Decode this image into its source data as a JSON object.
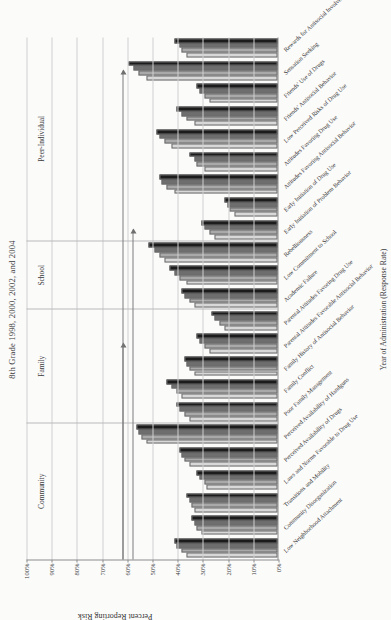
{
  "figure": {
    "title": "8th Grade 1998, 2000, 2002, and 2004",
    "x_caption": "Year of Administration (Response Rate)",
    "y_axis_label": "Percent Reporting Risk"
  },
  "chart_data": {
    "type": "bar",
    "title": "8th Grade 1998, 2000, 2002, and 2004",
    "xlabel": "Year of Administration (Response Rate)",
    "ylabel": "Percent Reporting Risk",
    "ylim": [
      0,
      100
    ],
    "grid": true,
    "legend_position": "none",
    "tick_labels": [
      "100%",
      "90%",
      "80%",
      "70%",
      "60%",
      "50%",
      "40%",
      "30%",
      "20%",
      "10%",
      "0%"
    ],
    "tick_values": [
      100,
      90,
      80,
      70,
      60,
      50,
      40,
      30,
      20,
      10,
      0
    ],
    "domains": [
      {
        "name": "Community",
        "start": 0,
        "end": 6
      },
      {
        "name": "Family",
        "start": 6,
        "end": 11
      },
      {
        "name": "School",
        "start": 11,
        "end": 14
      },
      {
        "name": "Peer-Individual",
        "start": 14,
        "end": 23
      }
    ],
    "categories": [
      "Low Neighborhood Attachment",
      "Community Disorganization",
      "Transitions and Mobility",
      "Laws and Norms Favorable to Drug Use",
      "Perceived Availability of Drugs",
      "Perceived Availability of Handguns",
      "Poor Family Management",
      "Family Conflict",
      "Family History of Antisocial Behavior",
      "Parental Attitudes Favorable Antisocial Behavior",
      "Parental Attitudes Favoring Drug Use",
      "Academic Failure",
      "Low Commitment to School",
      "Rebelliousness",
      "Early Initiation of Problem Behavior",
      "Early Initiation of Drug Use",
      "Attitudes Favoring Antisocial Behavior",
      "Attitudes Favoring Drug Use",
      "Low Perceived Risks of Drug Use",
      "Friends' Antisocial Behavior",
      "Friends' Use of Drugs",
      "Sensation Seeking",
      "Rewards for Antisocial Involvement"
    ],
    "series": [
      {
        "name": "1998",
        "color": "#d8d8d8",
        "values": [
          36,
          30,
          33,
          28,
          35,
          52,
          35,
          38,
          33,
          27,
          21,
          33,
          36,
          45,
          25,
          17,
          41,
          29,
          42,
          33,
          27,
          52,
          36
        ]
      },
      {
        "name": "2000",
        "color": "#a9a9a9",
        "values": [
          38,
          32,
          34,
          29,
          37,
          54,
          37,
          40,
          35,
          29,
          23,
          35,
          39,
          47,
          27,
          19,
          44,
          32,
          45,
          36,
          29,
          55,
          38
        ]
      },
      {
        "name": "2002",
        "color": "#6e6e6e",
        "values": [
          40,
          33,
          35,
          31,
          38,
          55,
          39,
          42,
          36,
          31,
          25,
          37,
          41,
          49,
          29,
          20,
          46,
          33,
          47,
          38,
          31,
          57,
          39
        ]
      },
      {
        "name": "2004",
        "color": "#1c1c1c",
        "values": [
          41,
          34,
          36,
          32,
          39,
          56,
          40,
          44,
          37,
          32,
          26,
          38,
          43,
          51,
          30,
          21,
          47,
          35,
          48,
          40,
          32,
          59,
          41
        ]
      }
    ],
    "annotations": [
      {
        "label": "",
        "category_index": 9,
        "value": 62
      },
      {
        "label": "",
        "category_index": 14,
        "value": 58
      },
      {
        "label": "",
        "category_index": 21,
        "value": 62
      }
    ]
  }
}
